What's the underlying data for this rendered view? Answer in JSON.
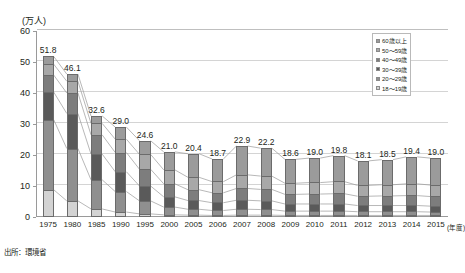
{
  "chart_data": {
    "type": "bar",
    "title": "",
    "subtitle": "",
    "xlabel": "年度",
    "ylabel": "万人",
    "unit_label": "(万人)",
    "ylim": [
      0,
      60
    ],
    "ytick_step": 10,
    "yticks": [
      "0",
      "10",
      "20",
      "30",
      "40",
      "50",
      "60"
    ],
    "grid": true,
    "legend_position": "top-right",
    "stacked": true,
    "categories": [
      "1975",
      "1980",
      "1985",
      "1990",
      "1995",
      "2000",
      "2005",
      "2006",
      "2007",
      "2008",
      "2009",
      "2010",
      "2011",
      "2012",
      "2013",
      "2014",
      "2015"
    ],
    "totals": [
      51.8,
      46.1,
      32.6,
      29.0,
      24.6,
      21.0,
      20.4,
      18.7,
      22.9,
      22.2,
      18.6,
      19.0,
      19.8,
      18.1,
      18.5,
      19.4,
      19.0
    ],
    "total_labels": [
      "51.8",
      "46.1",
      "32.6",
      "29.0",
      "24.6",
      "21.0",
      "20.4",
      "18.7",
      "22.9",
      "22.2",
      "18.6",
      "19.0",
      "19.8",
      "18.1",
      "18.5",
      "19.4",
      "19.0"
    ],
    "series": [
      {
        "name": "18～19歳",
        "color": "#d3d3d3",
        "values": [
          8.8,
          5.2,
          2.6,
          1.6,
          1.0,
          0.7,
          0.6,
          0.5,
          0.6,
          0.6,
          0.5,
          0.5,
          0.5,
          0.5,
          0.5,
          0.5,
          0.5
        ]
      },
      {
        "name": "20～29歳",
        "color": "#8f8f8f",
        "values": [
          22.6,
          16.9,
          9.4,
          6.6,
          4.2,
          2.5,
          1.9,
          1.6,
          1.9,
          1.8,
          1.4,
          1.4,
          1.4,
          1.2,
          1.2,
          1.2,
          1.1
        ]
      },
      {
        "name": "30～39歳",
        "color": "#5a5a5a",
        "values": [
          8.9,
          11.3,
          8.3,
          6.4,
          4.8,
          3.3,
          2.8,
          2.5,
          2.9,
          2.8,
          2.3,
          2.3,
          2.3,
          2.0,
          2.0,
          2.0,
          1.9
        ]
      },
      {
        "name": "40～49歳",
        "color": "#7d7d7d",
        "values": [
          5.5,
          6.6,
          6.2,
          6.2,
          5.4,
          4.2,
          3.5,
          3.2,
          3.8,
          3.7,
          3.1,
          3.2,
          3.3,
          3.0,
          3.1,
          3.2,
          3.1
        ]
      },
      {
        "name": "50～59歳",
        "color": "#a8a8a8",
        "values": [
          3.5,
          3.8,
          3.7,
          4.3,
          4.8,
          4.5,
          4.0,
          3.6,
          4.4,
          4.3,
          3.6,
          3.7,
          3.9,
          3.5,
          3.6,
          3.8,
          3.7
        ]
      },
      {
        "name": "60歳以上",
        "color": "#9b9b9b",
        "values": [
          2.5,
          2.3,
          2.4,
          3.9,
          4.4,
          5.8,
          7.6,
          7.3,
          9.3,
          9.0,
          7.7,
          7.9,
          8.4,
          7.9,
          8.1,
          8.7,
          8.7
        ]
      }
    ],
    "legend_entries": [
      "60歳以上",
      "50～59歳",
      "40～49歳",
      "30～39歳",
      "20～29歳",
      "18～19歳"
    ],
    "source_note": "出所：環境省"
  }
}
